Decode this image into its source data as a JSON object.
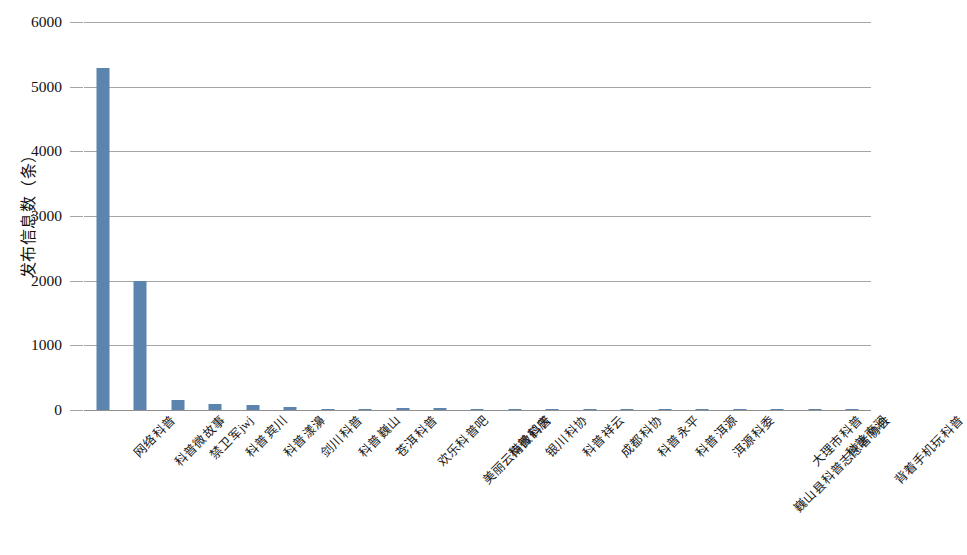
{
  "chart_data": {
    "type": "bar",
    "title": "",
    "xlabel": "",
    "ylabel": "发布信息数（条）",
    "ylim": [
      0,
      6000
    ],
    "ytick_labels": [
      "6000",
      "5000",
      "4000",
      "3000",
      "2000",
      "1000",
      "0"
    ],
    "yticks": [
      6000,
      5000,
      4000,
      3000,
      2000,
      1000,
      0
    ],
    "grid": true,
    "legend": false,
    "bar_color": "#5b84ae",
    "categories": [
      "网络科普",
      "科普微故事",
      "禁卫军jwj",
      "科普宾川",
      "科普漾濞",
      "剑川科普",
      "科普巍山",
      "苍洱科普",
      "欢乐科普吧",
      "美丽云南微科普",
      "科普鹤庆",
      "银川科协",
      "科普祥云",
      "成都科协",
      "科普永平",
      "科普洱源",
      "洱源科委",
      "巍山县科普志愿者协会",
      "大理市科普",
      "科普南涧",
      "背着手机玩科普"
    ],
    "values": [
      5290,
      1990,
      150,
      95,
      80,
      45,
      22,
      14,
      30,
      24,
      18,
      10,
      8,
      7,
      6,
      5,
      4,
      4,
      3,
      2,
      2
    ]
  }
}
